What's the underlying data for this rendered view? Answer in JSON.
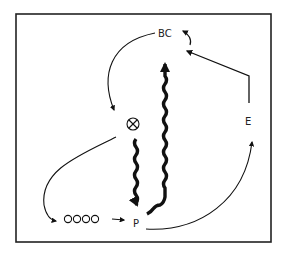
{
  "diagram": {
    "nodes": {
      "bc": {
        "label": "BC"
      },
      "e": {
        "label": "E"
      },
      "p": {
        "label": "P"
      },
      "circles": {
        "label": "OOOO"
      },
      "cross": {
        "label": "⊗"
      }
    },
    "edges": [
      {
        "from": "BC",
        "to": "cross",
        "style": "thin-curve"
      },
      {
        "from": "cross",
        "to": "OOOO",
        "style": "thin-curve"
      },
      {
        "from": "OOOO",
        "to": "P",
        "style": "short-arrow"
      },
      {
        "from": "cross",
        "to": "P",
        "style": "thick-wavy"
      },
      {
        "from": "P",
        "to": "BC",
        "style": "thick-wavy"
      },
      {
        "from": "P",
        "to": "E",
        "style": "thin-curve"
      },
      {
        "from": "E",
        "to": "BC",
        "style": "polyline"
      },
      {
        "from": "BC-right",
        "to": "BC",
        "style": "small-curl"
      }
    ],
    "colors": {
      "stroke": "#111111",
      "background": "#ffffff"
    }
  }
}
